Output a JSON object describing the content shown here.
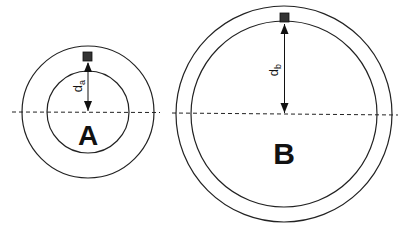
{
  "diagram": {
    "type": "concentric-circles-comparison",
    "baseline": {
      "style": "dashed",
      "color": "#222222"
    },
    "stroke_color": "#222222",
    "marker_color": "#333333",
    "circles": [
      {
        "id": "A",
        "label": "A",
        "distance_label": "d",
        "distance_subscript": "a",
        "center": [
          88,
          112
        ],
        "outer_radius": 66,
        "inner_radius": 41
      },
      {
        "id": "B",
        "label": "B",
        "distance_label": "d",
        "distance_subscript": "b",
        "center": [
          284,
          114
        ],
        "outer_radius": 108,
        "inner_radius": 93
      }
    ]
  }
}
